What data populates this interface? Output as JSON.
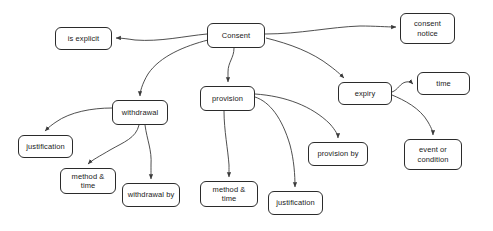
{
  "diagram": {
    "type": "concept-map",
    "title": "Consent",
    "width": 493,
    "height": 231,
    "background_color": "#ffffff",
    "node_border_color": "#2b2b2b",
    "node_fill_color": "#ffffff",
    "edge_color": "#3b3b3b",
    "text_color": "#1a1a1a",
    "nodes": [
      {
        "id": "consent",
        "label": "Consent",
        "x": 207,
        "y": 23,
        "w": 58,
        "h": 25
      },
      {
        "id": "is-explicit",
        "label": "is explicit",
        "x": 55,
        "y": 27,
        "w": 57,
        "h": 23
      },
      {
        "id": "consent-notice",
        "label": "consent\nnotice",
        "x": 400,
        "y": 13,
        "w": 55,
        "h": 31
      },
      {
        "id": "withdrawal",
        "label": "withdrawal",
        "x": 112,
        "y": 100,
        "w": 56,
        "h": 25
      },
      {
        "id": "provision",
        "label": "provision",
        "x": 200,
        "y": 86,
        "w": 55,
        "h": 25
      },
      {
        "id": "expiry",
        "label": "expiry",
        "x": 338,
        "y": 82,
        "w": 54,
        "h": 23
      },
      {
        "id": "time",
        "label": "time",
        "x": 417,
        "y": 72,
        "w": 53,
        "h": 23
      },
      {
        "id": "event-or-condition",
        "label": "event or\ncondition",
        "x": 404,
        "y": 139,
        "w": 58,
        "h": 31
      },
      {
        "id": "provision-by",
        "label": "provision by",
        "x": 308,
        "y": 142,
        "w": 60,
        "h": 24
      },
      {
        "id": "justification-withdrawal",
        "label": "justification",
        "x": 18,
        "y": 135,
        "w": 55,
        "h": 23
      },
      {
        "id": "method-time-withdrawal",
        "label": "method &\ntime",
        "x": 60,
        "y": 168,
        "w": 56,
        "h": 26
      },
      {
        "id": "withdrawal-by",
        "label": "withdrawal by",
        "x": 122,
        "y": 183,
        "w": 58,
        "h": 24
      },
      {
        "id": "method-time-provision",
        "label": "method &\ntime",
        "x": 200,
        "y": 181,
        "w": 58,
        "h": 26
      },
      {
        "id": "justification-provision",
        "label": "justification",
        "x": 268,
        "y": 191,
        "w": 55,
        "h": 24
      }
    ],
    "edges": [
      {
        "id": "e-consent-is-explicit",
        "from": "consent",
        "to": "is-explicit",
        "path": "M 207 34 C 185 36, 160 42, 135 40 C 128 39, 122 38, 116 38"
      },
      {
        "id": "e-consent-notice",
        "from": "consent",
        "to": "consent-notice",
        "path": "M 265 34 C 300 34, 330 27, 360 26 C 375 26, 387 27, 396 27"
      },
      {
        "id": "e-consent-withdrawal",
        "from": "consent",
        "to": "withdrawal",
        "path": "M 208 40 C 185 46, 160 56, 148 74 C 142 84, 140 92, 140 96"
      },
      {
        "id": "e-consent-provision",
        "from": "consent",
        "to": "provision",
        "path": "M 234 48 C 234 58, 228 62, 228 72 C 228 78, 228 80, 228 82"
      },
      {
        "id": "e-consent-expiry",
        "from": "consent",
        "to": "expiry",
        "path": "M 266 38 C 290 44, 312 52, 330 66 C 338 72, 342 76, 344 78"
      },
      {
        "id": "e-withdrawal-justification",
        "from": "withdrawal",
        "to": "justification-withdrawal",
        "path": "M 112 108 C 92 108, 70 112, 56 122 C 50 126, 47 129, 45 131"
      },
      {
        "id": "e-withdrawal-method-time",
        "from": "withdrawal",
        "to": "method-time-withdrawal",
        "path": "M 139 125 C 136 138, 124 142, 110 150 C 100 156, 92 160, 88 164"
      },
      {
        "id": "e-withdrawal-withdrawal-by",
        "from": "withdrawal",
        "to": "withdrawal-by",
        "path": "M 145 125 C 147 140, 152 150, 151 165 C 151 173, 151 177, 151 179"
      },
      {
        "id": "e-provision-method-time",
        "from": "provision",
        "to": "method-time-provision",
        "path": "M 224 111 C 224 130, 228 150, 229 165 C 229 172, 229 175, 229 177"
      },
      {
        "id": "e-provision-justification",
        "from": "provision",
        "to": "justification-provision",
        "path": "M 255 97 C 270 102, 282 118, 290 145 C 294 160, 295 175, 295 187"
      },
      {
        "id": "e-provision-provision-by",
        "from": "provision",
        "to": "provision-by",
        "path": "M 255 94 C 285 96, 312 106, 330 124 C 336 131, 338 135, 338 138"
      },
      {
        "id": "e-expiry-time",
        "from": "expiry",
        "to": "time",
        "path": "M 392 92 C 398 90, 400 83, 406 82 C 410 81, 412 83, 413 84"
      },
      {
        "id": "e-expiry-event",
        "from": "expiry",
        "to": "event-or-condition",
        "path": "M 392 95 C 404 100, 420 108, 428 122 C 432 129, 433 132, 433 135"
      }
    ]
  }
}
